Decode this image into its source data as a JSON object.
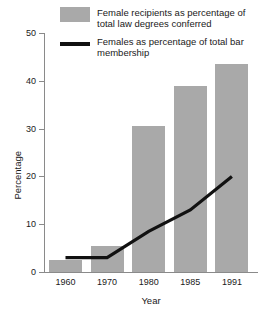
{
  "chart_data": {
    "type": "bar",
    "title": "",
    "xlabel": "Year",
    "ylabel": "Percentage",
    "categories": [
      "1960",
      "1970",
      "1980",
      "1985",
      "1991"
    ],
    "ylim": [
      0,
      50
    ],
    "yticks": [
      0,
      10,
      20,
      30,
      40,
      50
    ],
    "grid": false,
    "legend_position": "top",
    "series": [
      {
        "name": "Female recipients as percentage of total law degrees conferred",
        "type": "bar",
        "color": "#a9a9a9",
        "values": [
          2.5,
          5.5,
          30.5,
          39,
          43.5
        ]
      },
      {
        "name": "Females as percentage of total bar membership",
        "type": "line",
        "color": "#111111",
        "values": [
          3,
          3,
          8.5,
          13,
          20
        ]
      }
    ]
  },
  "legend": {
    "items": [
      {
        "key": "bar-swatch",
        "line1": "Female recipients as percentage of",
        "line2": "total law degrees conferred"
      },
      {
        "key": "line-swatch",
        "line1": "Females as percentage of total bar",
        "line2": "membership"
      }
    ]
  },
  "axes": {
    "y_title": "Percentage",
    "x_title": "Year",
    "y_ticks": [
      "50",
      "40",
      "30",
      "20",
      "10",
      "0"
    ],
    "x_ticks": [
      "1960",
      "1970",
      "1980",
      "1985",
      "1991"
    ]
  }
}
